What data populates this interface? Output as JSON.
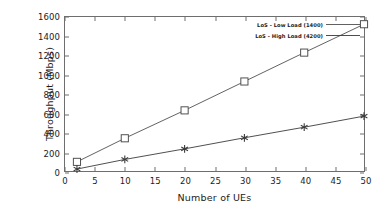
{
  "chart_data": {
    "type": "line",
    "title": "",
    "xlabel": "Number of UEs",
    "ylabel": "Throughput (Mbps)",
    "xlim": [
      0,
      50
    ],
    "ylim": [
      0,
      1600
    ],
    "xticks": [
      0,
      5,
      10,
      15,
      20,
      25,
      30,
      35,
      40,
      45,
      50
    ],
    "yticks": [
      0,
      200,
      400,
      600,
      800,
      1000,
      1200,
      1400,
      1600
    ],
    "grid": false,
    "legend_position": "top-right-inside",
    "x": [
      2,
      10,
      20,
      30,
      40,
      50
    ],
    "series": [
      {
        "name": "LoS - Low Load (1400)",
        "marker": "open-square",
        "color": "#4f4f4f",
        "values": [
          95,
          340,
          630,
          930,
          1230,
          1525
        ]
      },
      {
        "name": "LoS - High Load (4200)",
        "marker": "asterisk",
        "color": "#3a3a3a",
        "values": [
          20,
          120,
          230,
          345,
          455,
          570
        ]
      }
    ]
  },
  "colors": {
    "axis": "#6e6e6e",
    "text": "#1c1c1c",
    "background": "#ffffff"
  }
}
